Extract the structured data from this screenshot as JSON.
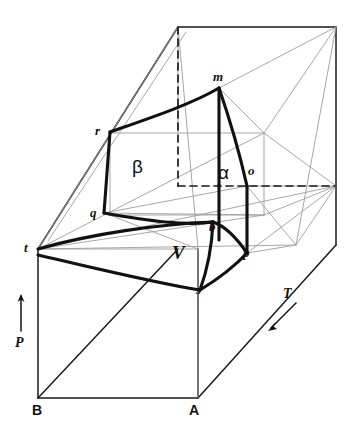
{
  "figure": {
    "kind": "pressure-volume-temperature-surface-diagram",
    "background": "#ffffff",
    "stroke_dark": "#1a1a1a",
    "stroke_light": "#9a9a9a",
    "width": 354,
    "height": 431
  },
  "axes": [
    {
      "id": "pressure",
      "label": "P",
      "x": 20,
      "y": 343,
      "direction": "up",
      "arrow": {
        "x1": 21,
        "y1": 331,
        "x2": 21,
        "y2": 294
      }
    },
    {
      "id": "temperature",
      "label": "T",
      "x": 287,
      "y": 294,
      "direction": "down-left",
      "arrow": {
        "x1": 296,
        "y1": 303,
        "x2": 268,
        "y2": 331
      }
    }
  ],
  "corner_labels": [
    {
      "id": "corner-B",
      "label": "B",
      "x": 32,
      "y": 405
    },
    {
      "id": "corner-A",
      "label": "A",
      "x": 189,
      "y": 405
    }
  ],
  "point_labels": [
    {
      "id": "point-m",
      "label": "m",
      "x": 213,
      "y": 70
    },
    {
      "id": "point-r",
      "label": "r",
      "x": 95,
      "y": 124
    },
    {
      "id": "point-o",
      "label": "o",
      "x": 248,
      "y": 164
    },
    {
      "id": "point-q",
      "label": "q",
      "x": 90,
      "y": 206
    },
    {
      "id": "point-b",
      "label": "b",
      "x": 209,
      "y": 220
    },
    {
      "id": "point-t",
      "label": "t",
      "x": 24,
      "y": 241
    },
    {
      "id": "point-p",
      "label": "p",
      "x": 243,
      "y": 246
    },
    {
      "id": "point-s",
      "label": "s",
      "x": 196,
      "y": 283
    }
  ],
  "region_labels": [
    {
      "id": "region-beta",
      "label": "β",
      "x": 132,
      "y": 157,
      "kind": "phase"
    },
    {
      "id": "region-alpha",
      "label": "α",
      "x": 218,
      "y": 163,
      "kind": "phase"
    },
    {
      "id": "region-V",
      "label": "V",
      "x": 172,
      "y": 243,
      "kind": "volume"
    }
  ],
  "header": {
    "faint_text": ""
  }
}
